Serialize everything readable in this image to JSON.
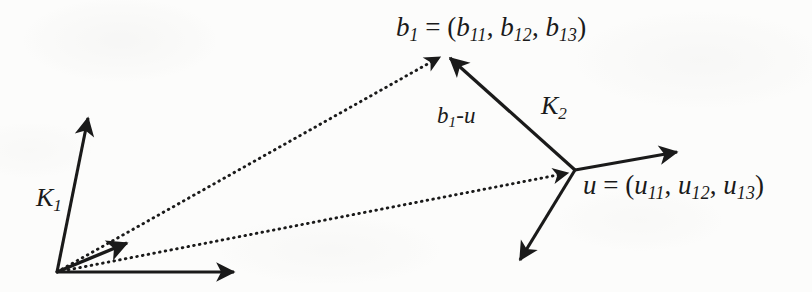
{
  "figure": {
    "type": "vector-diagram",
    "background_color": "#fbfbfa",
    "ink_color": "#1a1a1a"
  },
  "labels": {
    "b1_vector": {
      "base": "b",
      "base_sub": "1",
      "equals": " = (",
      "c1": "b",
      "c1_sub": "11",
      "sep1": ", ",
      "c2": "b",
      "c2_sub": "12",
      "sep2": ", ",
      "c3": "b",
      "c3_sub": "13",
      "close": ")",
      "text": "b1 = (b11, b12, b13)"
    },
    "u_vector": {
      "base": "u",
      "equals": " = (",
      "c1": "u",
      "c1_sub": "11",
      "sep1": ", ",
      "c2": "u",
      "c2_sub": "12",
      "sep2": ", ",
      "c3": "u",
      "c3_sub": "13",
      "close": ")",
      "text": "u = (u11, u12, u13)"
    },
    "frame_k1": {
      "base": "K",
      "sub": "1",
      "text": "K1"
    },
    "frame_k2": {
      "base": "K",
      "sub": "2",
      "text": "K2"
    },
    "difference": {
      "base": "b",
      "sub": "1",
      "rest": "-u",
      "text": "b1-u"
    }
  },
  "geometry": {
    "origin": {
      "x": 57,
      "y": 272
    },
    "point_b1": {
      "x": 446,
      "y": 50
    },
    "point_u": {
      "x": 575,
      "y": 170
    },
    "k1_axis_vertical_tip": {
      "x": 88,
      "y": 112
    },
    "k1_axis_horizontal_tip": {
      "x": 240,
      "y": 272
    },
    "k1_axis_diagonal_tip": {
      "x": 132,
      "y": 239
    },
    "k2_axis_right_tip": {
      "x": 683,
      "y": 151
    },
    "k2_axis_down_tip": {
      "x": 516,
      "y": 266
    },
    "dotted_origin_to_b1": {
      "from": "origin",
      "to": "point_b1",
      "style": "dotted",
      "arrow": true
    },
    "dotted_origin_to_u": {
      "from": "origin",
      "to": "point_u",
      "style": "dotted",
      "arrow": true
    },
    "solid_u_to_b1": {
      "from": "point_u",
      "to": "point_b1",
      "style": "solid",
      "arrow": true
    }
  }
}
